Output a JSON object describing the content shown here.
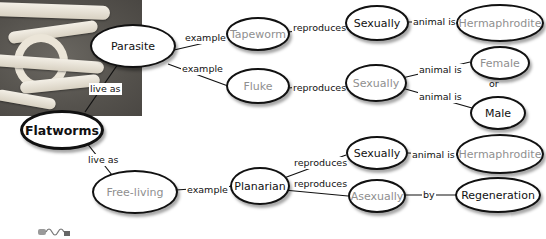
{
  "diagram": {
    "type": "concept-map",
    "root": "Flatworms",
    "nodes": {
      "flatworms": "Flatworms",
      "parasite": "Parasite",
      "free_living": "Free-living",
      "tapeworm": "Tapeworm",
      "fluke": "Fluke",
      "planarian": "Planarian",
      "tapeworm_sexually": "Sexually",
      "fluke_sexually": "Sexually",
      "planarian_sexually": "Sexually",
      "planarian_asexually": "Asexually",
      "tapeworm_hermaphrodite": "Hermaphrodite",
      "planarian_hermaphrodite": "Hermaphrodite",
      "female": "Female",
      "male": "Male",
      "regeneration": "Regeneration"
    },
    "links": {
      "live_as_parasite": "live as",
      "live_as_free": "live as",
      "example_tapeworm": "example",
      "example_fluke": "example",
      "example_planarian": "example",
      "tapeworm_reproduces": "reproduces",
      "fluke_reproduces": "reproduces",
      "planarian_reproduces_sex": "reproduces",
      "planarian_reproduces_asex": "reproduces",
      "tapeworm_animal_is": "animal is",
      "fluke_animal_is_female": "animal is",
      "fluke_animal_is_male": "animal is",
      "or": "or",
      "planarian_animal_is": "animal is",
      "by": "by"
    },
    "edges": [
      {
        "from": "Flatworms",
        "label": "live as",
        "to": "Parasite"
      },
      {
        "from": "Flatworms",
        "label": "live as",
        "to": "Free-living"
      },
      {
        "from": "Parasite",
        "label": "example",
        "to": "Tapeworm"
      },
      {
        "from": "Parasite",
        "label": "example",
        "to": "Fluke"
      },
      {
        "from": "Tapeworm",
        "label": "reproduces",
        "to": "Sexually"
      },
      {
        "from": "Sexually",
        "label": "animal is",
        "to": "Hermaphrodite"
      },
      {
        "from": "Fluke",
        "label": "reproduces",
        "to": "Sexually"
      },
      {
        "from": "Sexually",
        "label": "animal is",
        "to": "Female"
      },
      {
        "from": "Sexually",
        "label": "animal is",
        "to": "Male"
      },
      {
        "from": "Free-living",
        "label": "example",
        "to": "Planarian"
      },
      {
        "from": "Planarian",
        "label": "reproduces",
        "to": "Sexually"
      },
      {
        "from": "Sexually",
        "label": "animal is",
        "to": "Hermaphrodite"
      },
      {
        "from": "Planarian",
        "label": "reproduces",
        "to": "Asexually"
      },
      {
        "from": "Asexually",
        "label": "by",
        "to": "Regeneration"
      }
    ]
  },
  "photo": {
    "subject": "tapeworm-photo"
  },
  "colors": {
    "gray_text": "#8f8f8f",
    "line": "#111111"
  }
}
